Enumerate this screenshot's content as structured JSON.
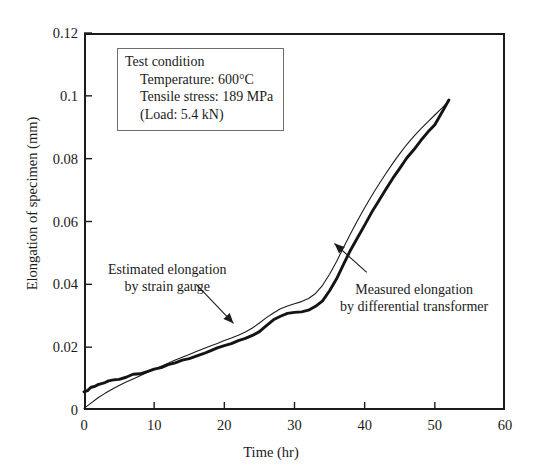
{
  "figure": {
    "caption_fragment": "",
    "background": "#ffffff",
    "ink_color": "#1c1c1c"
  },
  "chart_data": {
    "type": "line",
    "title": "",
    "xlabel": "Time (hr)",
    "ylabel": "Elongation of specimen (mm)",
    "xlim": [
      0,
      60
    ],
    "ylim": [
      0,
      0.12
    ],
    "xticks": [
      0,
      10,
      20,
      30,
      40,
      50,
      60
    ],
    "yticks": [
      0,
      0.02,
      0.04,
      0.06,
      0.08,
      0.1,
      0.12
    ],
    "xtick_labels": [
      "0",
      "10",
      "20",
      "30",
      "40",
      "50",
      "60"
    ],
    "ytick_labels": [
      "0",
      "0.02",
      "0.04",
      "0.06",
      "0.08",
      "0.1",
      "0.12"
    ],
    "grid": false,
    "legend": "none (curves identified by arrow annotations)",
    "tick_direction": "in",
    "series": [
      {
        "name": "Estimated elongation by strain gauge",
        "style": "thin smooth line",
        "line_width": 1,
        "color": "#1c1c1c",
        "x": [
          0,
          1,
          2,
          3,
          4,
          5,
          6,
          7,
          8,
          9,
          10,
          11,
          12,
          13,
          14,
          15,
          16,
          17,
          18,
          19,
          20,
          21,
          22,
          23,
          24,
          25,
          26,
          27,
          28,
          29,
          30,
          31,
          32,
          33,
          34,
          35,
          36,
          37,
          38,
          39,
          40,
          41,
          42,
          43,
          44,
          45,
          46,
          47,
          48,
          49,
          50,
          51,
          52
        ],
        "y": [
          0.0005,
          0.0022,
          0.0039,
          0.0053,
          0.0066,
          0.0078,
          0.0089,
          0.0099,
          0.0109,
          0.0119,
          0.0129,
          0.0139,
          0.0149,
          0.0159,
          0.0168,
          0.0177,
          0.0186,
          0.0195,
          0.0204,
          0.0212,
          0.0221,
          0.0229,
          0.0238,
          0.0248,
          0.0261,
          0.0277,
          0.0294,
          0.0309,
          0.0322,
          0.0331,
          0.0338,
          0.0345,
          0.0355,
          0.0371,
          0.0397,
          0.0432,
          0.0473,
          0.0518,
          0.0562,
          0.0604,
          0.0644,
          0.0682,
          0.0718,
          0.0752,
          0.0785,
          0.0816,
          0.0845,
          0.0871,
          0.0895,
          0.0917,
          0.0939,
          0.0961,
          0.0984
        ]
      },
      {
        "name": "Measured elongation by differential transformer",
        "style": "thick noisy line",
        "line_width": 3,
        "color": "#141414",
        "x": [
          0,
          0.5,
          1,
          1.5,
          2,
          2.5,
          3,
          3.5,
          4,
          4.5,
          5,
          6,
          7,
          8,
          9,
          10,
          11,
          12,
          13,
          14,
          15,
          16,
          17,
          18,
          19,
          20,
          21,
          22,
          23,
          24,
          25,
          26,
          27,
          28,
          29,
          30,
          31,
          32,
          33,
          34,
          35,
          36,
          37,
          38,
          39,
          40,
          41,
          42,
          43,
          44,
          45,
          46,
          47,
          48,
          49,
          50,
          51,
          52
        ],
        "y": [
          0.0055,
          0.0064,
          0.007,
          0.0075,
          0.008,
          0.0084,
          0.0088,
          0.0091,
          0.0094,
          0.0097,
          0.01,
          0.0106,
          0.0112,
          0.0118,
          0.0124,
          0.013,
          0.0137,
          0.0144,
          0.0151,
          0.0158,
          0.0165,
          0.0172,
          0.018,
          0.0188,
          0.0196,
          0.0204,
          0.0211,
          0.0218,
          0.0226,
          0.0237,
          0.0252,
          0.027,
          0.0286,
          0.0298,
          0.0306,
          0.0311,
          0.0315,
          0.032,
          0.033,
          0.0349,
          0.038,
          0.042,
          0.0464,
          0.0508,
          0.055,
          0.059,
          0.0628,
          0.0665,
          0.07,
          0.0735,
          0.0768,
          0.08,
          0.083,
          0.0858,
          0.0884,
          0.091,
          0.0947,
          0.0985
        ]
      }
    ],
    "annotations": [
      {
        "name": "estimated-elongation-annotation",
        "lines": [
          "Estimated elongation",
          "by strain gauge"
        ],
        "text_x": 13.0,
        "text_y": 0.0455,
        "arrow_from": [
          16.0,
          0.04
        ],
        "arrow_to": [
          21.3,
          0.0276
        ]
      },
      {
        "name": "measured-elongation-annotation",
        "lines": [
          "Measured elongation",
          "by differential transformer"
        ],
        "text_x": 45.0,
        "text_y": 0.0395,
        "arrow_from": [
          40.3,
          0.0438
        ],
        "arrow_to": [
          35.7,
          0.053
        ]
      }
    ]
  },
  "test_condition": {
    "heading": "Test condition",
    "temperature": "Temperature: 600°C",
    "tensile_stress": "Tensile stress: 189 MPa",
    "load": "(Load: 5.4 kN)"
  }
}
